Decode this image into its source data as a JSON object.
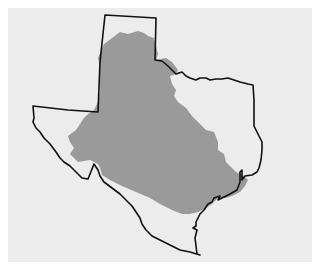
{
  "map": {
    "subject": "Texas state outline",
    "shaded_region": "Large interior region covering central/west Texas and panhandle",
    "colors": {
      "background": "#ffffff",
      "panel": "#ececec",
      "shaded_fill": "#9a9a9a",
      "outline_stroke": "#111111"
    },
    "labels": []
  }
}
